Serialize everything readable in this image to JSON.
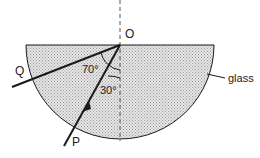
{
  "diagram": {
    "type": "refraction-semicircular-glass-block",
    "labels": {
      "origin": "O",
      "incident_point": "P",
      "emergent_point": "Q",
      "material": "glass",
      "angle_reflect": "70°",
      "angle_incident": "30°"
    },
    "colors": {
      "glass_fill": "#d9d9d9",
      "stroke": "#1a1a1a",
      "normal_line": "#555555"
    }
  }
}
